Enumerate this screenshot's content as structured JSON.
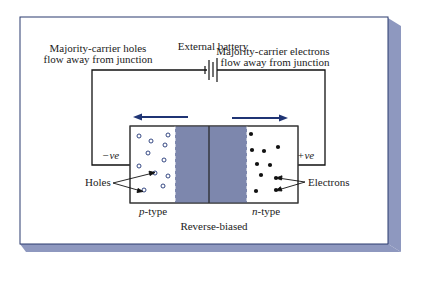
{
  "diagram": {
    "title_battery": "External battery",
    "left_caption_line1": "Majority-carrier holes",
    "left_caption_line2": "flow away from junction",
    "right_caption_line1": "Majority-carrier electrons",
    "right_caption_line2": "flow away from junction",
    "neg_terminal": "−ve",
    "pos_terminal": "+ve",
    "holes_label": "Holes",
    "electrons_label": "Electrons",
    "p_type_label_italic": "p",
    "p_type_label_rest": "-type",
    "n_type_label_italic": "n",
    "n_type_label_rest": "-type",
    "bias_label": "Reverse-biased",
    "colors": {
      "panel_border": "#2a3a6e",
      "panel_shadow": "#8e98bf",
      "depletion": "#7d87ad",
      "arrow": "#1f3474",
      "wire": "#111111"
    }
  }
}
